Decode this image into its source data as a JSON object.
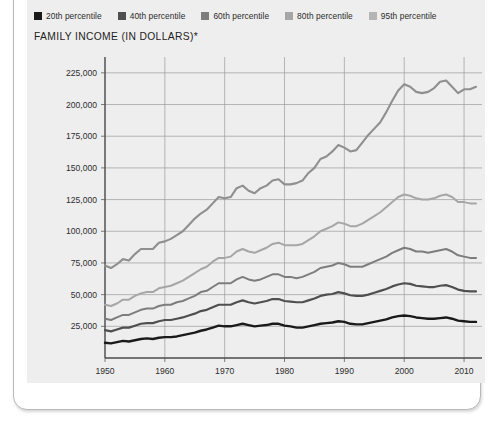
{
  "card": {
    "title": "FAMILY INCOME (IN DOLLARS)*"
  },
  "legend": {
    "position": "top-left",
    "items": [
      {
        "label": "20th percentile",
        "color": "#1a1a1a"
      },
      {
        "label": "40th percentile",
        "color": "#4f4f4f"
      },
      {
        "label": "60th percentile",
        "color": "#7d7d7d"
      },
      {
        "label": "80th percentile",
        "color": "#a6a6a6"
      },
      {
        "label": "95th percentile",
        "color": "#8f8f8f"
      }
    ]
  },
  "chart_data": {
    "type": "line",
    "title": "FAMILY INCOME (IN DOLLARS)*",
    "xlabel": "",
    "ylabel": "",
    "xlim": [
      1950,
      2013
    ],
    "ylim": [
      0,
      237500
    ],
    "ytick_labels": [
      "25,000",
      "50,000",
      "75,000",
      "100,000",
      "125,000",
      "150,000",
      "175,000",
      "200,000",
      "225,000"
    ],
    "ytick_values": [
      25000,
      50000,
      75000,
      100000,
      125000,
      150000,
      175000,
      200000,
      225000
    ],
    "xtick_labels": [
      "1950",
      "1960",
      "1970",
      "1980",
      "1990",
      "2000",
      "2010"
    ],
    "xtick_values": [
      1950,
      1960,
      1970,
      1980,
      1990,
      2000,
      2010
    ],
    "grid": "both",
    "legend": "top-left",
    "x": [
      1950,
      1951,
      1952,
      1953,
      1954,
      1955,
      1956,
      1957,
      1958,
      1959,
      1960,
      1961,
      1962,
      1963,
      1964,
      1965,
      1966,
      1967,
      1968,
      1969,
      1970,
      1971,
      1972,
      1973,
      1974,
      1975,
      1976,
      1977,
      1978,
      1979,
      1980,
      1981,
      1982,
      1983,
      1984,
      1985,
      1986,
      1987,
      1988,
      1989,
      1990,
      1991,
      1992,
      1993,
      1994,
      1995,
      1996,
      1997,
      1998,
      1999,
      2000,
      2001,
      2002,
      2003,
      2004,
      2005,
      2006,
      2007,
      2008,
      2009,
      2010,
      2011,
      2012
    ],
    "series": [
      {
        "name": "95th percentile",
        "color": "#8f8f8f",
        "width": 2.1,
        "values": [
          73000,
          71000,
          74000,
          78000,
          77000,
          82000,
          86000,
          86000,
          86000,
          91000,
          92000,
          94000,
          97000,
          100000,
          105000,
          110000,
          114000,
          117000,
          122000,
          127000,
          126000,
          127000,
          134000,
          136000,
          132000,
          130000,
          134000,
          136000,
          140000,
          141000,
          137000,
          137000,
          138000,
          140000,
          146000,
          150000,
          157000,
          159000,
          163000,
          168000,
          166000,
          163000,
          164000,
          170000,
          176000,
          181000,
          186000,
          194000,
          203000,
          211000,
          216000,
          214000,
          210000,
          209000,
          210000,
          213000,
          218000,
          219000,
          214000,
          209000,
          212000,
          212000,
          214000
        ]
      },
      {
        "name": "80th percentile",
        "color": "#a6a6a6",
        "width": 2.0,
        "values": [
          42000,
          41000,
          43000,
          46000,
          46000,
          49000,
          51000,
          52000,
          52000,
          55000,
          56000,
          57000,
          59000,
          61000,
          64000,
          67000,
          70000,
          72000,
          76000,
          79000,
          79000,
          80000,
          84000,
          86000,
          84000,
          83000,
          85000,
          87000,
          90000,
          91000,
          89000,
          89000,
          89000,
          90000,
          93000,
          96000,
          100000,
          102000,
          104000,
          107000,
          106000,
          104000,
          104000,
          106000,
          109000,
          112000,
          115000,
          119000,
          123000,
          127000,
          129000,
          128000,
          126000,
          125000,
          125000,
          126000,
          128000,
          129000,
          127000,
          123000,
          123000,
          122000,
          122000
        ]
      },
      {
        "name": "60th percentile",
        "color": "#7d7d7d",
        "width": 2.0,
        "values": [
          31000,
          30000,
          32000,
          34000,
          34000,
          36000,
          38000,
          39000,
          39000,
          41000,
          42000,
          42000,
          44000,
          45000,
          47000,
          49000,
          52000,
          53000,
          56000,
          59000,
          59000,
          59000,
          62000,
          64000,
          62000,
          61000,
          62000,
          64000,
          66000,
          66000,
          64000,
          64000,
          63000,
          64000,
          66000,
          68000,
          71000,
          72000,
          73000,
          75000,
          74000,
          72000,
          72000,
          72000,
          74000,
          76000,
          78000,
          80000,
          83000,
          85000,
          87000,
          86000,
          84000,
          84000,
          83000,
          84000,
          85000,
          86000,
          84000,
          81000,
          80000,
          79000,
          79000
        ]
      },
      {
        "name": "40th percentile",
        "color": "#4f4f4f",
        "width": 2.2,
        "values": [
          22000,
          21000,
          22500,
          24000,
          24000,
          25500,
          27000,
          27500,
          27500,
          29000,
          30000,
          30000,
          31000,
          32000,
          33500,
          35000,
          37000,
          38000,
          40000,
          42000,
          42000,
          42000,
          44000,
          45500,
          44000,
          43000,
          44000,
          45000,
          46500,
          46500,
          45000,
          44500,
          44000,
          44000,
          45500,
          47000,
          49000,
          50000,
          50500,
          52000,
          51000,
          49500,
          49000,
          49000,
          50000,
          51500,
          53000,
          54500,
          56500,
          58000,
          59000,
          58500,
          57000,
          56500,
          56000,
          56000,
          57000,
          57500,
          56000,
          54000,
          53000,
          52500,
          52500
        ]
      },
      {
        "name": "20th percentile",
        "color": "#1a1a1a",
        "width": 2.4,
        "values": [
          12000,
          11500,
          12500,
          13500,
          13000,
          14000,
          15000,
          15500,
          15000,
          16000,
          16500,
          16500,
          17000,
          18000,
          19000,
          20000,
          21500,
          22500,
          24000,
          25500,
          25000,
          25000,
          26000,
          27000,
          26000,
          25000,
          25500,
          26000,
          27000,
          27000,
          25500,
          25000,
          24000,
          24000,
          25000,
          26000,
          27000,
          27500,
          28000,
          29000,
          28500,
          27000,
          26500,
          26500,
          27500,
          28500,
          29500,
          30500,
          32000,
          33000,
          33500,
          33000,
          32000,
          31500,
          31000,
          31000,
          31500,
          32000,
          31000,
          29500,
          29000,
          28500,
          28500
        ]
      }
    ]
  }
}
